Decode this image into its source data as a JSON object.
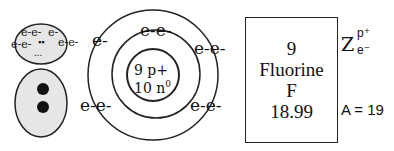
{
  "lewis_figure": {
    "head_electrons": [
      "e-e-",
      "e-",
      "e-e-",
      "e-e-"
    ],
    "head_dots": "▪▪",
    "head_small_dots": "...",
    "body_dots_count": 2
  },
  "bohr_model": {
    "nucleus": {
      "protons": "9 p+",
      "neutrons": "10 n",
      "neutron_sup": "0"
    },
    "inner_shell_electrons": [
      "e-e-"
    ],
    "outer_shell_electrons": [
      "e-",
      "e-e-",
      "e-e-",
      "e-e-"
    ]
  },
  "element_card": {
    "atomic_number": "9",
    "name": "Fluorine",
    "symbol": "F",
    "atomic_mass": "18.99"
  },
  "annotations": {
    "z_label": "Z",
    "z_sup": "p⁺",
    "z_sub": "e⁻",
    "mass_label": "A = 19"
  }
}
